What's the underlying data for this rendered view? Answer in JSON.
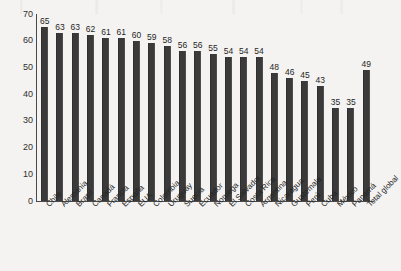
{
  "chart_data": {
    "type": "bar",
    "title": "",
    "subtitle": "",
    "xlabel": "",
    "ylabel": "",
    "ylim": [
      0,
      70
    ],
    "y_ticks": [
      0,
      10,
      20,
      30,
      40,
      50,
      60,
      70
    ],
    "grid": false,
    "legend": null,
    "bar_color": "#3a3a3a",
    "background_color": "#f4f3f1",
    "axis_color": "#4a4a4a",
    "categories": [
      "Chile",
      "Alemania",
      "Brasil",
      "Canadá",
      "Francia",
      "España",
      "EUA",
      "Colombia",
      "Uruguay",
      "Suecia",
      "Ecuador",
      "Noruega",
      "El Salvador",
      "Costa Rica",
      "Argentina",
      "Nicaragua",
      "Guatemala",
      "Perú",
      "Cuba",
      "México",
      "Panamá",
      "Total global"
    ],
    "values": [
      65,
      63,
      63,
      62,
      61,
      61,
      60,
      59,
      58,
      56,
      56,
      55,
      54,
      54,
      54,
      48,
      46,
      45,
      43,
      35,
      35,
      49
    ],
    "data_labels": [
      "65",
      "63",
      "63",
      "62",
      "61",
      "61",
      "60",
      "59",
      "58",
      "56",
      "56",
      "55",
      "54",
      "54",
      "54",
      "48",
      "46",
      "45",
      "43",
      "35",
      "35",
      "49"
    ]
  }
}
